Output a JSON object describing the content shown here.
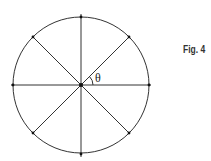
{
  "figure": {
    "label": "Fig. 4",
    "angle_symbol": "θ",
    "circle": {
      "cx": 81,
      "cy": 85,
      "r": 68
    },
    "spokes": 8,
    "colors": {
      "stroke": "#222222",
      "background": "#ffffff"
    }
  }
}
